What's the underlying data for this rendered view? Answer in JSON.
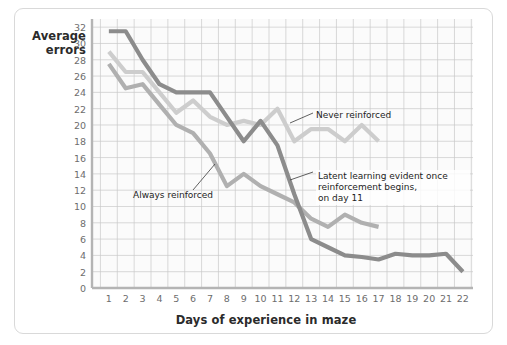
{
  "figure": {
    "y_axis_label": "Average\nerrors",
    "x_axis_label": "Days of experience in maze",
    "background_color": "#ffffff",
    "frame_color": "#d9d9d9"
  },
  "annotations": {
    "never_reinforced": "Never reinforced",
    "always_reinforced": "Always reinforced",
    "latent": "Latent learning evident once\nreinforcement begins,\non day 11"
  },
  "chart_data": {
    "type": "line",
    "title": "",
    "xlabel": "Days of experience in maze",
    "ylabel": "Average errors",
    "xlim": [
      0,
      22.6
    ],
    "ylim": [
      0,
      33
    ],
    "yticks": [
      0,
      2,
      4,
      6,
      8,
      10,
      12,
      14,
      16,
      18,
      20,
      22,
      24,
      26,
      28,
      30,
      32
    ],
    "xticks": [
      1,
      2,
      3,
      4,
      5,
      6,
      7,
      8,
      9,
      10,
      11,
      12,
      13,
      14,
      15,
      16,
      17,
      18,
      19,
      20,
      21,
      22
    ],
    "grid": true,
    "grid_color": "#c9c9c9",
    "legend": "none",
    "series": [
      {
        "name": "Never reinforced",
        "color": "#cdcdcd",
        "x": [
          1,
          2,
          3,
          4,
          5,
          6,
          7,
          8,
          9,
          10,
          11,
          12,
          13,
          14,
          15,
          16,
          17
        ],
        "values": [
          29.0,
          26.5,
          26.5,
          24.0,
          21.5,
          23.0,
          21.0,
          20.0,
          20.5,
          20.0,
          22.0,
          18.0,
          19.5,
          19.5,
          18.0,
          20.0,
          18.0
        ]
      },
      {
        "name": "Always reinforced",
        "color": "#b0b0b0",
        "x": [
          1,
          2,
          3,
          4,
          5,
          6,
          7,
          8,
          9,
          10,
          11,
          12,
          13,
          14,
          15,
          16,
          17
        ],
        "values": [
          27.5,
          24.5,
          25.0,
          22.5,
          20.0,
          19.0,
          16.5,
          12.5,
          14.0,
          12.5,
          11.5,
          10.5,
          8.5,
          7.5,
          9.0,
          8.0,
          7.5
        ]
      },
      {
        "name": "Latent learning (no reward until day 11)",
        "color": "#8c8c8c",
        "x": [
          1,
          2,
          3,
          4,
          5,
          6,
          7,
          8,
          9,
          10,
          11,
          12,
          13,
          14,
          15,
          16,
          17,
          18,
          19,
          20,
          21,
          22
        ],
        "values": [
          31.5,
          31.5,
          28.0,
          25.0,
          24.0,
          24.0,
          24.0,
          21.0,
          18.0,
          20.5,
          17.5,
          11.5,
          6.0,
          5.0,
          4.0,
          3.8,
          3.5,
          4.2,
          4.0,
          4.0,
          4.2,
          2.0
        ]
      }
    ]
  }
}
